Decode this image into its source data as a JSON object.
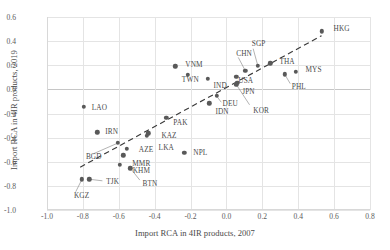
{
  "chart_data": {
    "type": "scatter",
    "title": "",
    "xlabel": "Import RCA in 4IR products, 2007",
    "ylabel": "Import RCA in 4IR products, 2019",
    "xlim": [
      -1.0,
      0.8
    ],
    "ylim": [
      -1.0,
      0.6
    ],
    "xticks": [
      "-1.0",
      "-0.8",
      "-0.6",
      "-0.4",
      "-0.2",
      "0.0",
      "0.2",
      "0.4",
      "0.6",
      "0.8"
    ],
    "xtick_values": [
      -1.0,
      -0.8,
      -0.6,
      -0.4,
      -0.2,
      0.0,
      0.2,
      0.4,
      0.6,
      0.8
    ],
    "yticks": [
      "0.6",
      "0.4",
      "0.2",
      "0.0",
      "-0.2",
      "-0.4",
      "-0.6",
      "-0.8",
      "-1.0"
    ],
    "ytick_values": [
      0.6,
      0.4,
      0.2,
      0.0,
      -0.2,
      -0.4,
      -0.6,
      -0.8,
      -1.0
    ],
    "grid": true,
    "legend": "none",
    "marker_color": "#595959",
    "grid_color": "#e4e4e4",
    "trendline": {
      "style": "dashed",
      "color": "#3a3a3a",
      "x0": -0.815,
      "y0": -0.645,
      "x1": 0.53,
      "y1": 0.445
    },
    "points": [
      {
        "label": "HKG",
        "x": 0.53,
        "y": 0.48,
        "lx": 12,
        "ly": -3
      },
      {
        "label": "SGP",
        "x": 0.175,
        "y": 0.195,
        "lx": -6,
        "ly": -22,
        "leader": true
      },
      {
        "label": "THA",
        "x": 0.245,
        "y": 0.215,
        "lx": 9,
        "ly": -2
      },
      {
        "label": "MYS",
        "x": 0.385,
        "y": 0.145,
        "lx": 10,
        "ly": -2
      },
      {
        "label": "PHL",
        "x": 0.325,
        "y": 0.125,
        "lx": 7,
        "ly": 12,
        "leader": true
      },
      {
        "label": "CHN",
        "x": 0.105,
        "y": 0.155,
        "lx": -9,
        "ly": -17,
        "leader": true
      },
      {
        "label": "VNM",
        "x": -0.285,
        "y": 0.19,
        "lx": 10,
        "ly": -2
      },
      {
        "label": "TWN",
        "x": -0.215,
        "y": 0.12,
        "lx": -6,
        "ly": 5
      },
      {
        "label": "IND",
        "x": -0.105,
        "y": 0.09,
        "lx": 6,
        "ly": 7
      },
      {
        "label": "USA",
        "x": 0.055,
        "y": 0.105,
        "lx": 2,
        "ly": 4
      },
      {
        "label": "JPN",
        "x": 0.06,
        "y": 0.055,
        "lx": 5,
        "ly": 9
      },
      {
        "label": "KOR",
        "x": 0.055,
        "y": 0.04,
        "lx": 17,
        "ly": 26,
        "leader": true
      },
      {
        "label": "DEU",
        "x": -0.055,
        "y": -0.055,
        "lx": 6,
        "ly": 8,
        "leader": true
      },
      {
        "label": "IDN",
        "x": -0.095,
        "y": -0.115,
        "lx": 6,
        "ly": 8
      },
      {
        "label": "PAK",
        "x": -0.335,
        "y": -0.235,
        "lx": 7,
        "ly": 5
      },
      {
        "label": "KAZ",
        "x": -0.435,
        "y": -0.365,
        "lx": 13,
        "ly": 2
      },
      {
        "label": "LKA",
        "x": -0.445,
        "y": -0.385,
        "lx": 12,
        "ly": 12
      },
      {
        "label": "IRN",
        "x": -0.72,
        "y": -0.355,
        "lx": 8,
        "ly": -1
      },
      {
        "label": "BGD",
        "x": -0.605,
        "y": -0.445,
        "lx": -32,
        "ly": 14,
        "leader": true
      },
      {
        "label": "AZE",
        "x": -0.555,
        "y": -0.495,
        "lx": 12,
        "ly": 1
      },
      {
        "label": "MMR",
        "x": -0.575,
        "y": -0.545,
        "lx": 9,
        "ly": 8
      },
      {
        "label": "NPL",
        "x": -0.235,
        "y": -0.525,
        "lx": 9,
        "ly": 0
      },
      {
        "label": "KHM",
        "x": -0.595,
        "y": -0.625,
        "lx": 13,
        "ly": 6
      },
      {
        "label": "BTN",
        "x": -0.535,
        "y": -0.655,
        "lx": 12,
        "ly": 15,
        "leader": true
      },
      {
        "label": "TJK",
        "x": -0.765,
        "y": -0.745,
        "lx": 17,
        "ly": 2,
        "leader": true
      },
      {
        "label": "KGZ",
        "x": -0.805,
        "y": -0.745,
        "lx": -8,
        "ly": 16,
        "leader": true
      },
      {
        "label": "LAO",
        "x": -0.795,
        "y": -0.145,
        "lx": 8,
        "ly": 1
      }
    ]
  }
}
